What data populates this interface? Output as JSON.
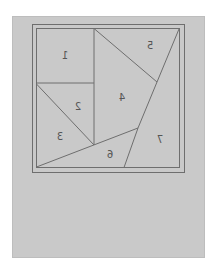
{
  "diagram": {
    "type": "dissection-puzzle",
    "mirrored": true,
    "colors": {
      "panel": "#c9c9c9",
      "lines": "#6e6e6e",
      "labels": "#555555"
    },
    "pieces": [
      {
        "id": "1",
        "label": "1"
      },
      {
        "id": "2",
        "label": "2"
      },
      {
        "id": "3",
        "label": "3"
      },
      {
        "id": "4",
        "label": "4"
      },
      {
        "id": "5",
        "label": "5"
      },
      {
        "id": "6",
        "label": "6"
      },
      {
        "id": "7",
        "label": "7"
      }
    ]
  }
}
